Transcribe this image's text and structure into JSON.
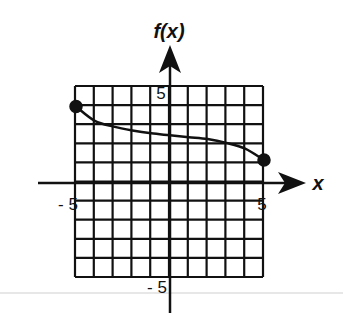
{
  "chart_data": {
    "type": "line",
    "title": "",
    "xlabel": "x",
    "ylabel": "f(x)",
    "xlim": [
      -5,
      5
    ],
    "ylim": [
      -5,
      5
    ],
    "grid": true,
    "grid_step": 1,
    "tick_labels": {
      "x": [
        {
          "value": -5,
          "label": "- 5"
        },
        {
          "value": 5,
          "label": "5"
        }
      ],
      "y": [
        {
          "value": 5,
          "label": "5"
        },
        {
          "value": -5,
          "label": "- 5"
        }
      ]
    },
    "series": [
      {
        "name": "f(x)",
        "x": [
          -5,
          -4,
          -3,
          -2,
          -1,
          0,
          1,
          2,
          3,
          4,
          5
        ],
        "y": [
          4,
          3.25,
          2.95,
          2.75,
          2.6,
          2.5,
          2.4,
          2.3,
          2.1,
          1.8,
          1.2
        ],
        "endpoints": [
          {
            "x": -5,
            "y": 4,
            "closed": true
          },
          {
            "x": 5,
            "y": 1.2,
            "closed": true
          }
        ]
      }
    ],
    "legend": null
  },
  "labels": {
    "y_axis_title": "f(x)",
    "x_axis_title": "x",
    "y_top_tick": "5",
    "y_bottom_tick": "- 5",
    "x_left_tick": "- 5",
    "x_right_tick": "5"
  },
  "colors": {
    "ink": "#111111",
    "grid": "#111111",
    "background": "#ffffff",
    "rule": "#cfcfcf"
  }
}
